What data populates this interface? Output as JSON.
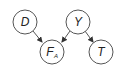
{
  "diagram": {
    "nodes": [
      {
        "id": "D",
        "label": "D",
        "sub": "",
        "cx": 25,
        "cy": 22
      },
      {
        "id": "Y",
        "label": "Y",
        "sub": "",
        "cx": 78,
        "cy": 22
      },
      {
        "id": "FA",
        "label": "F",
        "sub": "A",
        "cx": 52,
        "cy": 52
      },
      {
        "id": "T",
        "label": "T",
        "sub": "",
        "cx": 101,
        "cy": 52
      }
    ],
    "edges": [
      {
        "from": "D",
        "to": "FA"
      },
      {
        "from": "Y",
        "to": "FA"
      },
      {
        "from": "Y",
        "to": "T"
      }
    ],
    "colors": {
      "stroke": "#555555",
      "fill": "#ffffff",
      "text": "#222222"
    }
  }
}
